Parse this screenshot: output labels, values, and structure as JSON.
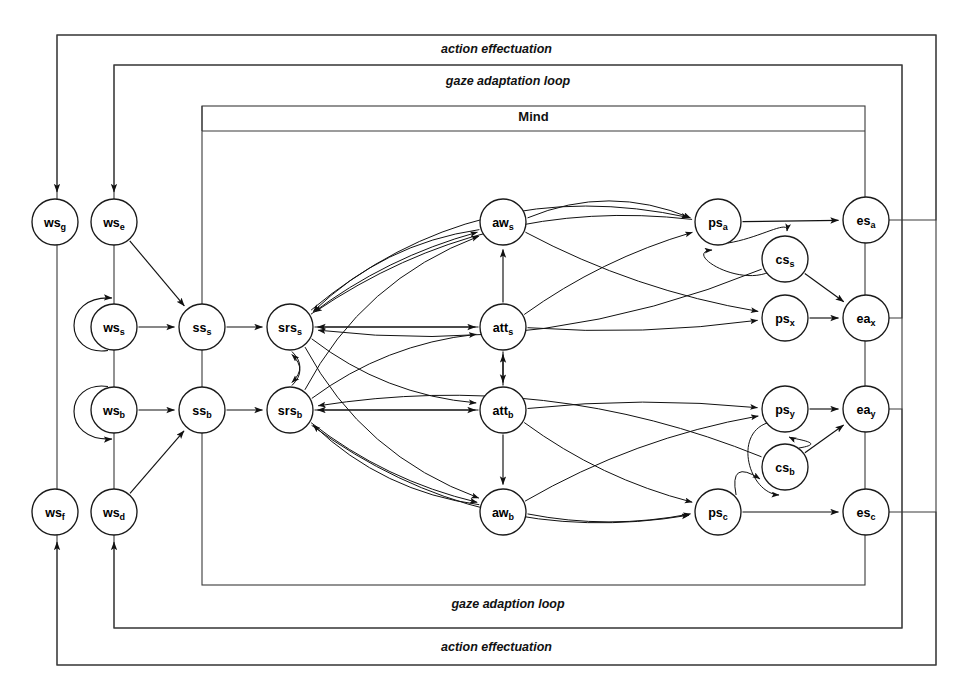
{
  "diagram": {
    "width": 973,
    "height": 699,
    "background": "#ffffff",
    "stroke_color": "#111111",
    "frame_stroke_color": "#3a3a3a"
  },
  "frames": [
    {
      "id": "outer",
      "top_label": "action effectuation",
      "bottom_label": "action effectuation",
      "x": 57,
      "y": 35,
      "w": 879,
      "h": 630,
      "top_label_y": 50,
      "bottom_label_y": 648
    },
    {
      "id": "middle",
      "top_label": "gaze adaptation loop",
      "bottom_label": "gaze adaption loop",
      "x": 114,
      "y": 65,
      "w": 788,
      "h": 563,
      "top_label_y": 82,
      "bottom_label_y": 605
    },
    {
      "id": "mind",
      "top_label": "Mind",
      "bottom_label": "",
      "x": 202,
      "y": 106,
      "w": 663,
      "h": 479,
      "top_label_y": 118,
      "divider_y": 131
    }
  ],
  "nodes": [
    {
      "id": "ws_g",
      "base": "ws",
      "sub": "g",
      "x": 55,
      "y": 222,
      "r": 23
    },
    {
      "id": "ws_e",
      "base": "ws",
      "sub": "e",
      "x": 114,
      "y": 222,
      "r": 23
    },
    {
      "id": "ws_s",
      "base": "ws",
      "sub": "s",
      "x": 114,
      "y": 327,
      "r": 23
    },
    {
      "id": "ss_s",
      "base": "ss",
      "sub": "s",
      "x": 202,
      "y": 327,
      "r": 23
    },
    {
      "id": "srs_s",
      "base": "srs",
      "sub": "s",
      "x": 290,
      "y": 327,
      "r": 23
    },
    {
      "id": "ws_b",
      "base": "ws",
      "sub": "b",
      "x": 114,
      "y": 410,
      "r": 23
    },
    {
      "id": "ss_b",
      "base": "ss",
      "sub": "b",
      "x": 202,
      "y": 410,
      "r": 23
    },
    {
      "id": "srs_b",
      "base": "srs",
      "sub": "b",
      "x": 290,
      "y": 410,
      "r": 23
    },
    {
      "id": "ws_f",
      "base": "ws",
      "sub": "f",
      "x": 55,
      "y": 512,
      "r": 23
    },
    {
      "id": "ws_d",
      "base": "ws",
      "sub": "d",
      "x": 114,
      "y": 512,
      "r": 23
    },
    {
      "id": "aw_s",
      "base": "aw",
      "sub": "s",
      "x": 503,
      "y": 222,
      "r": 23
    },
    {
      "id": "att_s",
      "base": "att",
      "sub": "s",
      "x": 503,
      "y": 327,
      "r": 23
    },
    {
      "id": "att_b",
      "base": "att",
      "sub": "b",
      "x": 503,
      "y": 410,
      "r": 23
    },
    {
      "id": "aw_b",
      "base": "aw",
      "sub": "b",
      "x": 503,
      "y": 512,
      "r": 23
    },
    {
      "id": "ps_a",
      "base": "ps",
      "sub": "a",
      "x": 718,
      "y": 222,
      "r": 23
    },
    {
      "id": "cs_s",
      "base": "cs",
      "sub": "s",
      "x": 785,
      "y": 259,
      "r": 23
    },
    {
      "id": "ps_x",
      "base": "ps",
      "sub": "x",
      "x": 785,
      "y": 318,
      "r": 23
    },
    {
      "id": "ps_y",
      "base": "ps",
      "sub": "y",
      "x": 785,
      "y": 409,
      "r": 23
    },
    {
      "id": "cs_b",
      "base": "cs",
      "sub": "b",
      "x": 785,
      "y": 467,
      "r": 23
    },
    {
      "id": "ps_c",
      "base": "ps",
      "sub": "c",
      "x": 718,
      "y": 512,
      "r": 23
    },
    {
      "id": "es_a",
      "base": "es",
      "sub": "a",
      "x": 866,
      "y": 220,
      "r": 23
    },
    {
      "id": "ea_x",
      "base": "ea",
      "sub": "x",
      "x": 866,
      "y": 318,
      "r": 23
    },
    {
      "id": "ea_y",
      "base": "ea",
      "sub": "y",
      "x": 866,
      "y": 409,
      "r": 23
    },
    {
      "id": "es_c",
      "base": "es",
      "sub": "c",
      "x": 866,
      "y": 512,
      "r": 23
    }
  ],
  "edges": [
    {
      "from": "ws_s",
      "to": "ss_s",
      "kind": "straight"
    },
    {
      "from": "ws_b",
      "to": "ss_b",
      "kind": "straight"
    },
    {
      "from": "ws_e",
      "to": "ss_s",
      "kind": "straight"
    },
    {
      "from": "ws_d",
      "to": "ss_b",
      "kind": "straight"
    },
    {
      "from": "ss_s",
      "to": "srs_s",
      "kind": "straight"
    },
    {
      "from": "ss_b",
      "to": "srs_b",
      "kind": "straight"
    },
    {
      "from": "ws_s",
      "to": "ws_s",
      "kind": "self-loop-left-up"
    },
    {
      "from": "ws_b",
      "to": "ws_b",
      "kind": "self-loop-left-down"
    },
    {
      "from": "srs_s",
      "to": "aw_s",
      "kind": "curve"
    },
    {
      "from": "srs_s",
      "to": "att_s",
      "kind": "straight"
    },
    {
      "from": "srs_s",
      "to": "att_b",
      "kind": "curve"
    },
    {
      "from": "srs_s",
      "to": "aw_b",
      "kind": "curve"
    },
    {
      "from": "srs_b",
      "to": "aw_s",
      "kind": "curve"
    },
    {
      "from": "srs_b",
      "to": "att_s",
      "kind": "curve"
    },
    {
      "from": "srs_b",
      "to": "att_b",
      "kind": "straight"
    },
    {
      "from": "srs_b",
      "to": "aw_b",
      "kind": "curve"
    },
    {
      "from": "srs_s",
      "to": "srs_b",
      "kind": "curve"
    },
    {
      "from": "srs_b",
      "to": "srs_s",
      "kind": "curve"
    },
    {
      "from": "aw_s",
      "to": "srs_s",
      "kind": "curve"
    },
    {
      "from": "att_s",
      "to": "srs_s",
      "kind": "straight"
    },
    {
      "from": "att_b",
      "to": "srs_b",
      "kind": "straight"
    },
    {
      "from": "aw_b",
      "to": "srs_b",
      "kind": "curve"
    },
    {
      "from": "att_b",
      "to": "att_s",
      "kind": "straight"
    },
    {
      "from": "att_s",
      "to": "att_b",
      "kind": "straight"
    },
    {
      "from": "att_s",
      "to": "aw_s",
      "kind": "straight"
    },
    {
      "from": "att_b",
      "to": "aw_b",
      "kind": "straight"
    },
    {
      "from": "aw_s",
      "to": "ps_a",
      "kind": "curve"
    },
    {
      "from": "aw_s",
      "to": "ps_x",
      "kind": "curve"
    },
    {
      "from": "att_s",
      "to": "ps_a",
      "kind": "curve"
    },
    {
      "from": "att_s",
      "to": "ps_x",
      "kind": "curve"
    },
    {
      "from": "att_b",
      "to": "ps_y",
      "kind": "curve"
    },
    {
      "from": "att_b",
      "to": "ps_c",
      "kind": "curve"
    },
    {
      "from": "aw_b",
      "to": "ps_y",
      "kind": "curve"
    },
    {
      "from": "aw_b",
      "to": "ps_c",
      "kind": "curve"
    },
    {
      "from": "srs_s",
      "to": "ps_a",
      "kind": "curve"
    },
    {
      "from": "srs_b",
      "to": "ps_c",
      "kind": "curve"
    },
    {
      "from": "cs_s",
      "to": "ps_a",
      "kind": "loop"
    },
    {
      "from": "ps_a",
      "to": "cs_s",
      "kind": "loop"
    },
    {
      "from": "cs_b",
      "to": "ps_y",
      "kind": "loop"
    },
    {
      "from": "ps_y",
      "to": "cs_b",
      "kind": "loop"
    },
    {
      "from": "cs_s",
      "to": "srs_s",
      "kind": "curve"
    },
    {
      "from": "cs_b",
      "to": "srs_b",
      "kind": "curve"
    },
    {
      "from": "cs_s",
      "to": "ea_x",
      "kind": "straight"
    },
    {
      "from": "cs_b",
      "to": "ea_y",
      "kind": "straight"
    },
    {
      "from": "ps_a",
      "to": "es_a",
      "kind": "straight"
    },
    {
      "from": "ps_x",
      "to": "ea_x",
      "kind": "straight"
    },
    {
      "from": "ps_y",
      "to": "ea_y",
      "kind": "straight"
    },
    {
      "from": "ps_c",
      "to": "es_c",
      "kind": "straight"
    },
    {
      "from": "ps_a",
      "to": "srs_s",
      "kind": "curve"
    },
    {
      "from": "ps_c",
      "to": "cs_b",
      "kind": "curve"
    }
  ],
  "feedback_routes": [
    {
      "id": "es_a_to_ws_g",
      "label": "action effectuation",
      "from": "es_a",
      "to": "ws_g"
    },
    {
      "id": "ea_x_to_ws_e",
      "label": "gaze adaptation loop",
      "from": "ea_x",
      "to": "ws_e"
    },
    {
      "id": "ea_y_to_ss_b",
      "label": "gaze adaption loop",
      "from": "ea_y",
      "to": "ws_d"
    },
    {
      "id": "es_c_to_ws_f",
      "label": "action effectuation",
      "from": "es_c",
      "to": "ws_f"
    }
  ]
}
